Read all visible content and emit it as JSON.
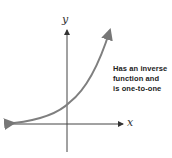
{
  "diagram": {
    "type": "function-graph",
    "axes": {
      "x_label": "x",
      "y_label": "y"
    },
    "curve": {
      "kind": "exponential-growth",
      "color": "#8a8a8a"
    },
    "annotation": {
      "lines": [
        "Has an inverse",
        "function and",
        "is one-to-one"
      ]
    }
  }
}
